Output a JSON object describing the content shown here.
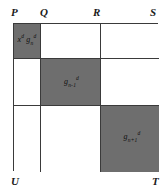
{
  "figure": {
    "type": "grid-diagram",
    "colors": {
      "shaded_block": "#6e6e6e",
      "unshaded_block": "#ffffff",
      "line": "#3a3a3a",
      "text": "#101010",
      "background": "#ffffff"
    }
  },
  "vertices": {
    "top_left": "P",
    "top_mid_left": "Q",
    "top_mid_right": "R",
    "top_right": "S",
    "bottom_left": "U",
    "bottom_right": "T"
  },
  "grid": {
    "rows": 3,
    "columns": 3,
    "cells": [
      [
        {
          "shaded": true,
          "label_plain": "x^d g_n^d",
          "base1": "x",
          "sup1": "d",
          "base2": "g",
          "sub2": "n",
          "sup2": "d",
          "has_label": true
        },
        {
          "shaded": false,
          "label_plain": "",
          "has_label": false
        },
        {
          "shaded": false,
          "label_plain": "",
          "has_label": false
        }
      ],
      [
        {
          "shaded": false,
          "label_plain": "",
          "has_label": false
        },
        {
          "shaded": true,
          "label_plain": "g_{n-1}^d",
          "base2": "g",
          "sub2": "n-1",
          "sup2": "d",
          "has_label": true
        },
        {
          "shaded": false,
          "label_plain": "",
          "has_label": false
        }
      ],
      [
        {
          "shaded": false,
          "label_plain": "",
          "has_label": false
        },
        {
          "shaded": false,
          "label_plain": "",
          "has_label": false
        },
        {
          "shaded": true,
          "label_plain": "g_{n+1}^d",
          "base2": "g",
          "sub2": "n+1",
          "sup2": "d",
          "has_label": true
        }
      ]
    ]
  },
  "labels": {
    "cell_0_0": {
      "base1": "x",
      "sup1": "d",
      "base2": "g",
      "sub2": "n",
      "sup2": "d"
    },
    "cell_1_1": {
      "base2": "g",
      "sub2": "n-1",
      "sup2": "d"
    },
    "cell_2_2": {
      "base2": "g",
      "sub2": "n+1",
      "sup2": "d"
    }
  }
}
